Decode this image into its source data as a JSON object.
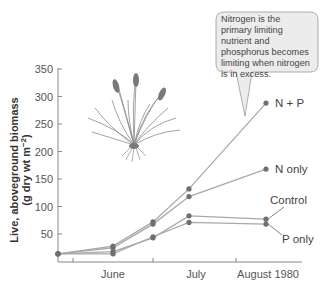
{
  "chart_data": {
    "type": "line",
    "title": "",
    "xlabel": "",
    "ylabel": "Live, aboveground biomass",
    "ylabel_units": "(g dry wt m⁻²)",
    "ylim": [
      0,
      350
    ],
    "yticks": [
      50,
      100,
      150,
      200,
      250,
      300,
      350
    ],
    "xtick_labels": [
      "June",
      "July",
      "August 1980"
    ],
    "grid": false,
    "legend_position": "inline at line ends",
    "x": [
      "early June",
      "mid June",
      "late June",
      "mid July",
      "August"
    ],
    "series": [
      {
        "name": "N + P",
        "values": [
          14,
          28,
          72,
          132,
          288
        ]
      },
      {
        "name": "N only",
        "values": [
          14,
          25,
          68,
          118,
          168
        ]
      },
      {
        "name": "Control",
        "values": [
          14,
          18,
          43,
          83,
          77
        ]
      },
      {
        "name": "P only",
        "values": [
          14,
          14,
          45,
          71,
          68
        ]
      }
    ],
    "annotation": "Nitrogen is the primary limiting nutrient and phosphorus becomes limiting when nitrogen is in excess.",
    "illustration": "grass-plant"
  },
  "colors": {
    "line": "#a9a9a9",
    "marker": "#6f6f6f",
    "axis": "#7a7a7a",
    "callout_fill": "#ececec",
    "callout_border": "#9a9a9a"
  },
  "labels": {
    "y350": "350",
    "y300": "300",
    "y250": "250",
    "y200": "200",
    "y150": "150",
    "y100": "100",
    "y50": "50",
    "x_june": "June",
    "x_july": "July",
    "x_august": "August 1980",
    "ylabel_line1": "Live, aboveground biomass",
    "ylabel_line2": "(g dry wt m",
    "ylabel_sup": "−2",
    "ylabel_close": ")",
    "np": "N + P",
    "n_only": "N only",
    "control": "Control",
    "p_only": "P only",
    "callout": "Nitrogen is the primary limiting nutrient and phosphorus becomes limiting when nitrogen is in excess."
  }
}
